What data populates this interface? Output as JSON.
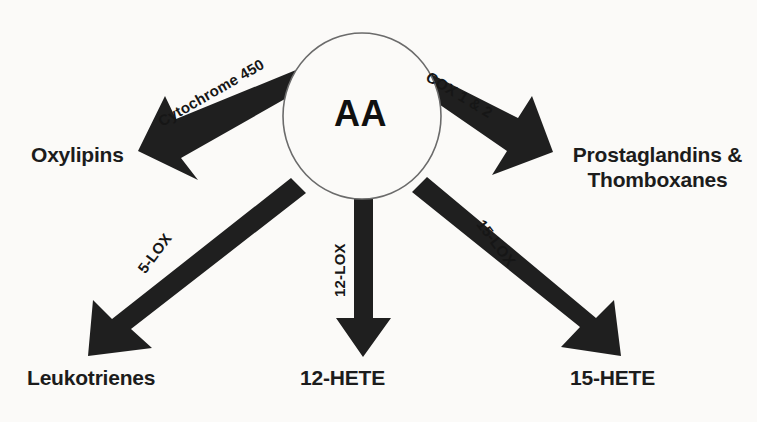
{
  "diagram": {
    "center_node": {
      "id": "AA",
      "label": "AA",
      "shape": "ellipse"
    },
    "colors": {
      "background": "#fbfaf8",
      "arrow": "#1f1f1f",
      "text": "#1c1c1c",
      "ellipse_stroke": "#6b6b6b"
    },
    "edges": [
      {
        "id": "cytochrome450",
        "enzyme_label": "Cytochrome 450",
        "target": "Oxylipins",
        "direction": "upper-left"
      },
      {
        "id": "cox",
        "enzyme_label": "COX 1 & 2",
        "target": "Prostaglandins & Thomboxanes",
        "direction": "upper-right"
      },
      {
        "id": "lox5",
        "enzyme_label": "5-LOX",
        "target": "Leukotrienes",
        "direction": "lower-left"
      },
      {
        "id": "lox12",
        "enzyme_label": "12-LOX",
        "target": "12-HETE",
        "direction": "down"
      },
      {
        "id": "lox15",
        "enzyme_label": "15-LOX",
        "target": "15-HETE",
        "direction": "lower-right"
      }
    ],
    "nodes": [
      {
        "id": "oxylipins",
        "label": "Oxylipins"
      },
      {
        "id": "prostaglandins",
        "label_line1": "Prostaglandins &",
        "label_line2": "Thomboxanes"
      },
      {
        "id": "leukotrienes",
        "label": "Leukotrienes"
      },
      {
        "id": "hete12",
        "label": "12-HETE"
      },
      {
        "id": "hete15",
        "label": "15-HETE"
      }
    ]
  }
}
